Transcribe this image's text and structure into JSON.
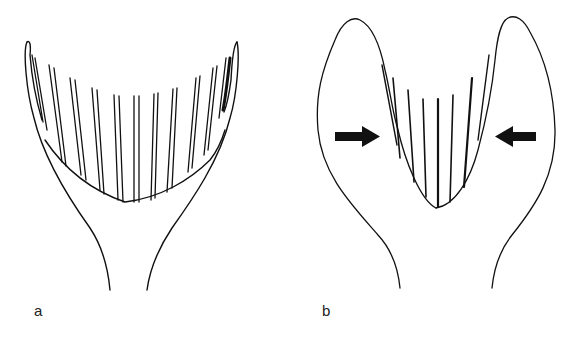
{
  "figure": {
    "type": "schematic line drawing",
    "panels": [
      {
        "id": "a",
        "label": "a",
        "description": "Open U-shaped cup with a fringe of paired parallel vertical lines rising from a curved base, flaring walls narrowing to a stalk at the bottom",
        "fringe_count": 11
      },
      {
        "id": "b",
        "label": "b",
        "description": "Two swollen lateral lobes compressing the central U; inward-pointing arrows on each side; fringe lines pushed together",
        "fringe_count": 8,
        "arrows": [
          {
            "side": "left",
            "direction": "right"
          },
          {
            "side": "right",
            "direction": "left"
          }
        ]
      }
    ],
    "colors": {
      "ink": "#111111",
      "background": "#ffffff"
    }
  }
}
